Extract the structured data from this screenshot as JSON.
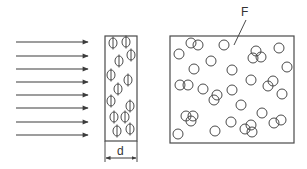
{
  "diagram": {
    "labels": {
      "thickness": "d",
      "film": "F"
    },
    "colors": {
      "stroke": "#4a4a4a",
      "background": "#ffffff"
    },
    "arrows": {
      "count": 8,
      "x_start": 16,
      "x_end": 88,
      "y": [
        42,
        56,
        69,
        82,
        95,
        108,
        122,
        135
      ],
      "direction": "right"
    },
    "side_view": {
      "x": 105,
      "y": 36,
      "width": 32,
      "height": 105,
      "particle_symbol": "Φ",
      "particles": [
        [
          113,
          43
        ],
        [
          126,
          42
        ],
        [
          131,
          55
        ],
        [
          119,
          61
        ],
        [
          111,
          75
        ],
        [
          128,
          80
        ],
        [
          118,
          89
        ],
        [
          111,
          101
        ],
        [
          130,
          106
        ],
        [
          114,
          117
        ],
        [
          125,
          117
        ],
        [
          117,
          131
        ],
        [
          130,
          129
        ]
      ],
      "dimension": {
        "y": 158,
        "label_y": 153
      }
    },
    "front_view": {
      "x": 170,
      "y": 36,
      "width": 124,
      "height": 107,
      "circle_radius": 5,
      "particles": [
        [
          191,
          43
        ],
        [
          198,
          45
        ],
        [
          224,
          45
        ],
        [
          179,
          54
        ],
        [
          256,
          51
        ],
        [
          253,
          58
        ],
        [
          261,
          57
        ],
        [
          279,
          48
        ],
        [
          211,
          61
        ],
        [
          194,
          69
        ],
        [
          232,
          70
        ],
        [
          287,
          67
        ],
        [
          180,
          85
        ],
        [
          188,
          85
        ],
        [
          203,
          89
        ],
        [
          251,
          80
        ],
        [
          273,
          81
        ],
        [
          268,
          86
        ],
        [
          232,
          90
        ],
        [
          217,
          95
        ],
        [
          214,
          100
        ],
        [
          282,
          94
        ],
        [
          241,
          105
        ],
        [
          262,
          113
        ],
        [
          186,
          116
        ],
        [
          193,
          116
        ],
        [
          191,
          121
        ],
        [
          231,
          122
        ],
        [
          274,
          123
        ],
        [
          281,
          120
        ],
        [
          178,
          134
        ],
        [
          215,
          131
        ],
        [
          245,
          129
        ],
        [
          251,
          125
        ],
        [
          252,
          132
        ]
      ],
      "leader": {
        "x1": 246,
        "y1": 20,
        "x2": 234,
        "y2": 45,
        "label_x": 241,
        "label_y": 6
      }
    }
  }
}
